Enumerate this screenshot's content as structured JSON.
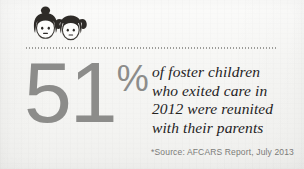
{
  "background": {
    "color": "#f5f5f3",
    "texture": "paper-grain"
  },
  "icon": {
    "name": "two-children-faces-icon",
    "description": "Two cartoon child faces, left with hair bun, right with pigtails",
    "hair_color": "#2e2b28",
    "face_color": "#fdfdfc",
    "face_outline": "#3a3734"
  },
  "divider": {
    "name": "dotted-divider",
    "style": "dotted",
    "color": "#9c9c99"
  },
  "stat": {
    "number": "51",
    "percent_symbol": "%",
    "color": "#8c8c8a"
  },
  "statement": {
    "lines": [
      "of foster children",
      "who exited care in",
      "2012 were reunited",
      "with their parents"
    ],
    "color": "#25231f"
  },
  "source": {
    "text": "*Source: AFCARS Report, July 2013",
    "color": "#7b7b78"
  }
}
